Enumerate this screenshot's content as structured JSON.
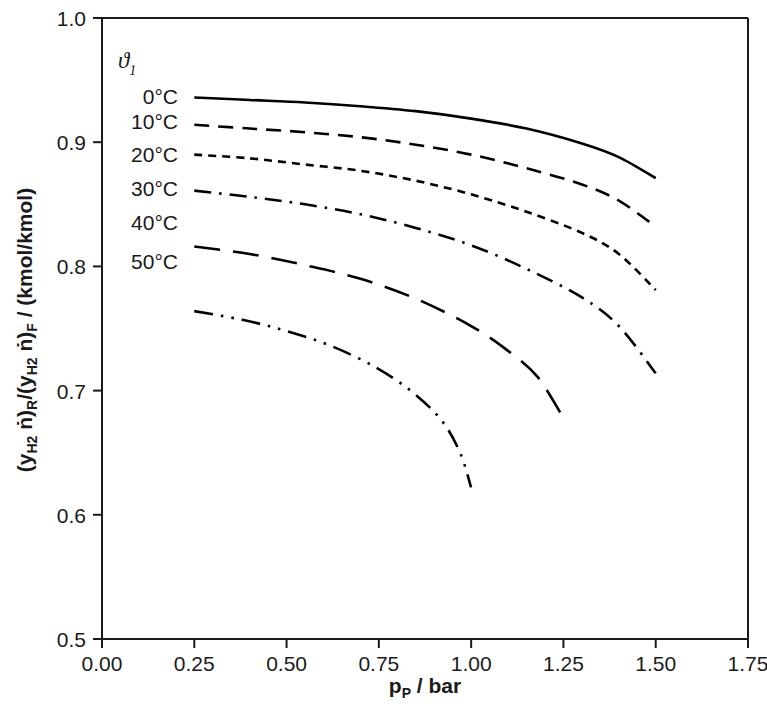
{
  "chart_data": {
    "type": "line",
    "title": "",
    "xlabel": "pP / bar",
    "xlabel_base": "p",
    "xlabel_sub": "P",
    "xlabel_unit": "/ bar",
    "ylabel": "(yH2 ṅ)R/(yH2 ṅ)F / (kmol/kmol)",
    "xlim": [
      0.0,
      1.75
    ],
    "ylim": [
      0.5,
      1.0
    ],
    "xticks": [
      "0.00",
      "0.25",
      "0.50",
      "0.75",
      "1.00",
      "1.25",
      "1.50",
      "1.75"
    ],
    "xtick_values": [
      0.0,
      0.25,
      0.5,
      0.75,
      1.0,
      1.25,
      1.5,
      1.75
    ],
    "yticks": [
      "0.5",
      "0.6",
      "0.7",
      "0.8",
      "0.9",
      "1.0"
    ],
    "ytick_values": [
      0.5,
      0.6,
      0.7,
      0.8,
      0.9,
      1.0
    ],
    "grid": false,
    "legend_position": "inside-upper-left",
    "legend_title": "ϑ",
    "legend_title_sub": "1",
    "series": [
      {
        "name": "0°C",
        "dash": "none",
        "x": [
          0.25,
          0.4,
          0.55,
          0.7,
          0.85,
          1.0,
          1.15,
          1.3,
          1.4,
          1.5
        ],
        "values": [
          0.936,
          0.934,
          0.932,
          0.929,
          0.925,
          0.919,
          0.911,
          0.899,
          0.888,
          0.871
        ]
      },
      {
        "name": "10°C",
        "dash": "dashed-long",
        "x": [
          0.25,
          0.4,
          0.55,
          0.7,
          0.85,
          1.0,
          1.15,
          1.3,
          1.4,
          1.5
        ],
        "values": [
          0.914,
          0.911,
          0.908,
          0.904,
          0.898,
          0.89,
          0.879,
          0.866,
          0.853,
          0.832
        ]
      },
      {
        "name": "20°C",
        "dash": "dashed-short",
        "x": [
          0.25,
          0.4,
          0.55,
          0.7,
          0.85,
          1.0,
          1.15,
          1.3,
          1.4,
          1.5
        ],
        "values": [
          0.89,
          0.887,
          0.882,
          0.877,
          0.869,
          0.858,
          0.844,
          0.827,
          0.81,
          0.781
        ]
      },
      {
        "name": "30°C",
        "dash": "dash-dot",
        "x": [
          0.25,
          0.4,
          0.55,
          0.7,
          0.85,
          1.0,
          1.15,
          1.3,
          1.4,
          1.5
        ],
        "values": [
          0.861,
          0.856,
          0.85,
          0.842,
          0.831,
          0.817,
          0.798,
          0.775,
          0.752,
          0.714
        ]
      },
      {
        "name": "40°C",
        "dash": "dashed-xlong",
        "x": [
          0.25,
          0.4,
          0.55,
          0.7,
          0.85,
          1.0,
          1.1,
          1.18,
          1.25
        ],
        "values": [
          0.816,
          0.81,
          0.801,
          0.79,
          0.774,
          0.752,
          0.732,
          0.711,
          0.678
        ]
      },
      {
        "name": "50°C",
        "dash": "dash-dot-dot",
        "x": [
          0.25,
          0.38,
          0.5,
          0.62,
          0.74,
          0.84,
          0.92,
          0.97,
          1.0
        ],
        "values": [
          0.764,
          0.757,
          0.748,
          0.736,
          0.719,
          0.699,
          0.676,
          0.65,
          0.622
        ]
      }
    ]
  },
  "legend": {
    "title": "ϑ",
    "title_sub": "1",
    "entries": [
      {
        "label": "0°C"
      },
      {
        "label": "10°C"
      },
      {
        "label": "20°C"
      },
      {
        "label": "30°C"
      },
      {
        "label": "40°C"
      },
      {
        "label": "50°C"
      }
    ]
  },
  "axes": {
    "y_label_parts": {
      "p1": "(y",
      "p1sub": "H2",
      "p2": " ṅ)",
      "p2sub": "R",
      "p3": "/(y",
      "p3sub": "H2",
      "p4": " ṅ)",
      "p4sub": "F",
      "p5": " / (kmol/kmol)"
    }
  }
}
